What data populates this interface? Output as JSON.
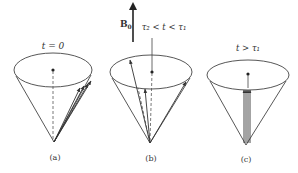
{
  "field": {
    "label": "B",
    "subscript": "0"
  },
  "panels": [
    {
      "id": "a",
      "caption": "(a)",
      "condition": "t = 0"
    },
    {
      "id": "b",
      "caption": "(b)",
      "condition": "τ₂ < t < τ₁"
    },
    {
      "id": "c",
      "caption": "(c)",
      "condition": "t > τ₁"
    }
  ],
  "colors": {
    "line": "#444444",
    "background": "#ffffff"
  }
}
